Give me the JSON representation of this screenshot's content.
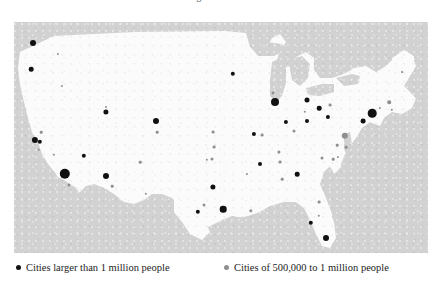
{
  "title": {
    "clipped_text": "Distribution of Large Cities in the United States"
  },
  "map": {
    "background_color": "#d2d2d2",
    "land_color": "#fbfbfb",
    "lake_color": "#d2d2d2",
    "panel": {
      "x": 14,
      "y": 22,
      "width": 414,
      "height": 231
    }
  },
  "legend": {
    "items": [
      {
        "label": "Cities larger than 1 million people",
        "color": "#111111",
        "name": "legend-large-cities"
      },
      {
        "label": "Cities of 500,000 to 1 million people",
        "color": "#8f8f8f",
        "name": "legend-medium-cities"
      }
    ]
  },
  "chart_data": {
    "type": "scatter",
    "title": "Distribution of Large Cities in the United States",
    "xlabel": "",
    "ylabel": "",
    "projection": "United States outline map",
    "legend_position": "bottom",
    "grid": false,
    "series": [
      {
        "name": "Cities larger than 1 million people",
        "color": "#111111",
        "marker": "filled-circle",
        "count": 34
      },
      {
        "name": "Cities of 500,000 to 1 million people",
        "color": "#8f8f8f",
        "marker": "filled-circle",
        "count": 30
      }
    ],
    "points": [
      {
        "city": "Seattle",
        "x": 19,
        "y": 21,
        "r": 3.0,
        "cls": "big"
      },
      {
        "city": "Portland",
        "x": 17,
        "y": 47,
        "r": 2.3,
        "cls": "big"
      },
      {
        "city": "Spokane",
        "x": 44,
        "y": 32,
        "r": 1.1,
        "cls": "mid"
      },
      {
        "city": "Boise",
        "x": 48,
        "y": 64,
        "r": 1.1,
        "cls": "mid"
      },
      {
        "city": "San Francisco",
        "x": 21,
        "y": 118,
        "r": 3.1,
        "cls": "big"
      },
      {
        "city": "Oakland",
        "x": 26,
        "y": 120,
        "r": 2.2,
        "cls": "big"
      },
      {
        "city": "Sacramento",
        "x": 27,
        "y": 110,
        "r": 1.3,
        "cls": "mid"
      },
      {
        "city": "San Jose",
        "x": 25,
        "y": 128,
        "r": 1.2,
        "cls": "mid"
      },
      {
        "city": "Fresno",
        "x": 40,
        "y": 133,
        "r": 1.2,
        "cls": "mid"
      },
      {
        "city": "Los Angeles",
        "x": 51,
        "y": 152,
        "r": 5.2,
        "cls": "big"
      },
      {
        "city": "San Diego",
        "x": 55,
        "y": 163,
        "r": 1.5,
        "cls": "mid"
      },
      {
        "city": "Las Vegas",
        "x": 70,
        "y": 134,
        "r": 2.2,
        "cls": "big"
      },
      {
        "city": "Salt Lake City",
        "x": 92,
        "y": 90,
        "r": 2.6,
        "cls": "big"
      },
      {
        "city": "Phoenix",
        "x": 92,
        "y": 154,
        "r": 3.0,
        "cls": "big"
      },
      {
        "city": "Tucson",
        "x": 98,
        "y": 164,
        "r": 1.3,
        "cls": "mid"
      },
      {
        "city": "Albuquerque",
        "x": 126,
        "y": 140,
        "r": 1.3,
        "cls": "mid"
      },
      {
        "city": "El Paso",
        "x": 132,
        "y": 172,
        "r": 1.2,
        "cls": "mid"
      },
      {
        "city": "Billings",
        "x": 92,
        "y": 85,
        "r": 1.0,
        "cls": "mid"
      },
      {
        "city": "Denver",
        "x": 142,
        "y": 99,
        "r": 3.0,
        "cls": "big"
      },
      {
        "city": "Colorado Spgs",
        "x": 143,
        "y": 110,
        "r": 1.3,
        "cls": "mid"
      },
      {
        "city": "Wichita",
        "x": 200,
        "y": 125,
        "r": 1.4,
        "cls": "mid"
      },
      {
        "city": "Omaha",
        "x": 199,
        "y": 110,
        "r": 1.4,
        "cls": "mid"
      },
      {
        "city": "Minneapolis",
        "x": 219,
        "y": 52,
        "r": 2.2,
        "cls": "big"
      },
      {
        "city": "Kansas City",
        "x": 240,
        "y": 112,
        "r": 2.1,
        "cls": "big"
      },
      {
        "city": "Tulsa",
        "x": 193,
        "y": 138,
        "r": 1.2,
        "cls": "mid"
      },
      {
        "city": "Oklahoma City",
        "x": 198,
        "y": 137,
        "r": 1.5,
        "cls": "mid"
      },
      {
        "city": "Dallas",
        "x": 199,
        "y": 165,
        "r": 2.6,
        "cls": "big"
      },
      {
        "city": "Fort Worth",
        "x": 190,
        "y": 183,
        "r": 1.5,
        "cls": "mid"
      },
      {
        "city": "San Antonio",
        "x": 184,
        "y": 190,
        "r": 2.2,
        "cls": "big"
      },
      {
        "city": "Houston",
        "x": 209,
        "y": 187,
        "r": 3.3,
        "cls": "big"
      },
      {
        "city": "Chicago",
        "x": 261,
        "y": 80,
        "r": 4.0,
        "cls": "big"
      },
      {
        "city": "Milwaukee",
        "x": 259,
        "y": 71,
        "r": 1.5,
        "cls": "mid"
      },
      {
        "city": "Detroit",
        "x": 293,
        "y": 78,
        "r": 2.5,
        "cls": "big"
      },
      {
        "city": "Cleveland",
        "x": 305,
        "y": 86,
        "r": 2.3,
        "cls": "big"
      },
      {
        "city": "Toledo",
        "x": 291,
        "y": 90,
        "r": 1.2,
        "cls": "mid"
      },
      {
        "city": "Indianapolis",
        "x": 272,
        "y": 100,
        "r": 2.1,
        "cls": "big"
      },
      {
        "city": "Columbus",
        "x": 293,
        "y": 99,
        "r": 2.0,
        "cls": "big"
      },
      {
        "city": "Cincinnati",
        "x": 280,
        "y": 109,
        "r": 1.5,
        "cls": "mid"
      },
      {
        "city": "Pittsburgh",
        "x": 314,
        "y": 95,
        "r": 2.1,
        "cls": "big"
      },
      {
        "city": "St. Louis",
        "x": 248,
        "y": 113,
        "r": 1.4,
        "cls": "mid"
      },
      {
        "city": "Louisville",
        "x": 265,
        "y": 130,
        "r": 1.6,
        "cls": "mid"
      },
      {
        "city": "Nashville",
        "x": 266,
        "y": 140,
        "r": 1.4,
        "cls": "mid"
      },
      {
        "city": "Memphis",
        "x": 246,
        "y": 142,
        "r": 2.0,
        "cls": "big"
      },
      {
        "city": "Buffalo",
        "x": 316,
        "y": 83,
        "r": 1.4,
        "cls": "mid"
      },
      {
        "city": "New York",
        "x": 358,
        "y": 91,
        "r": 4.3,
        "cls": "big"
      },
      {
        "city": "Newark",
        "x": 349,
        "y": 99,
        "r": 2.4,
        "cls": "big"
      },
      {
        "city": "Philadelphia",
        "x": 331,
        "y": 114,
        "r": 3.2,
        "cls": "mid"
      },
      {
        "city": "Baltimore",
        "x": 323,
        "y": 123,
        "r": 1.3,
        "cls": "mid"
      },
      {
        "city": "Washington DC",
        "x": 319,
        "y": 137,
        "r": 1.3,
        "cls": "mid"
      },
      {
        "city": "Boston",
        "x": 375,
        "y": 80,
        "r": 1.8,
        "cls": "mid"
      },
      {
        "city": "Providence",
        "x": 378,
        "y": 88,
        "r": 1.2,
        "cls": "mid"
      },
      {
        "city": "Hartford",
        "x": 366,
        "y": 86,
        "r": 1.1,
        "cls": "mid"
      },
      {
        "city": "Portland ME",
        "x": 388,
        "y": 50,
        "r": 0.9,
        "cls": "mid"
      },
      {
        "city": "Richmond",
        "x": 324,
        "y": 135,
        "r": 1.1,
        "cls": "mid"
      },
      {
        "city": "Norfolk",
        "x": 332,
        "y": 125,
        "r": 1.3,
        "cls": "mid"
      },
      {
        "city": "Charlotte",
        "x": 308,
        "y": 136,
        "r": 1.5,
        "cls": "mid"
      },
      {
        "city": "Atlanta",
        "x": 283,
        "y": 152,
        "r": 2.3,
        "cls": "big"
      },
      {
        "city": "Birmingham",
        "x": 268,
        "y": 157,
        "r": 1.3,
        "cls": "mid"
      },
      {
        "city": "New Orleans",
        "x": 237,
        "y": 189,
        "r": 1.7,
        "cls": "mid"
      },
      {
        "city": "Jacksonville",
        "x": 305,
        "y": 180,
        "r": 1.4,
        "cls": "mid"
      },
      {
        "city": "Tampa",
        "x": 297,
        "y": 201,
        "r": 2.2,
        "cls": "big"
      },
      {
        "city": "Orlando",
        "x": 305,
        "y": 194,
        "r": 1.2,
        "cls": "mid"
      },
      {
        "city": "Miami",
        "x": 312,
        "y": 216,
        "r": 3.0,
        "cls": "big"
      },
      {
        "city": "Little Rock",
        "x": 233,
        "y": 152,
        "r": 1.0,
        "cls": "mid"
      }
    ]
  }
}
